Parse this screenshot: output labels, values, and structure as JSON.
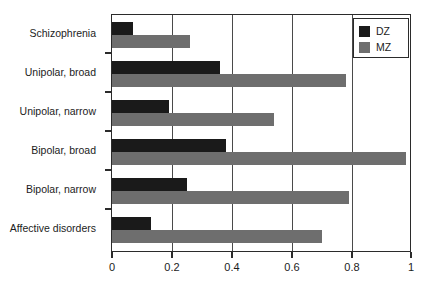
{
  "chart_data": {
    "type": "bar",
    "orientation": "horizontal",
    "title": "",
    "xlabel": "",
    "ylabel": "",
    "xlim": [
      0,
      1
    ],
    "ylim": null,
    "grid": "vertical",
    "legend_position": "top-right",
    "categories": [
      "Schizophrenia",
      "Unipolar, broad",
      "Unipolar, narrow",
      "Bipolar, broad",
      "Bipolar, narrow",
      "Affective disorders"
    ],
    "series": [
      {
        "name": "DZ",
        "color": "#1a1a1a",
        "values": [
          0.07,
          0.36,
          0.19,
          0.38,
          0.25,
          0.13
        ]
      },
      {
        "name": "MZ",
        "color": "#6e6e6e",
        "values": [
          0.26,
          0.78,
          0.54,
          0.98,
          0.79,
          0.7
        ]
      }
    ],
    "xticks": [
      "0",
      "0.2",
      "0.4",
      "0.6",
      "0.8",
      "1"
    ],
    "xtick_values": [
      0,
      0.2,
      0.4,
      0.6,
      0.8,
      1
    ]
  },
  "legend": {
    "items": [
      {
        "label": "DZ",
        "color": "#1a1a1a"
      },
      {
        "label": "MZ",
        "color": "#6e6e6e"
      }
    ]
  },
  "axis": {
    "frame_color": "#2b2b2b",
    "grid_color": "#4a4a4a"
  }
}
